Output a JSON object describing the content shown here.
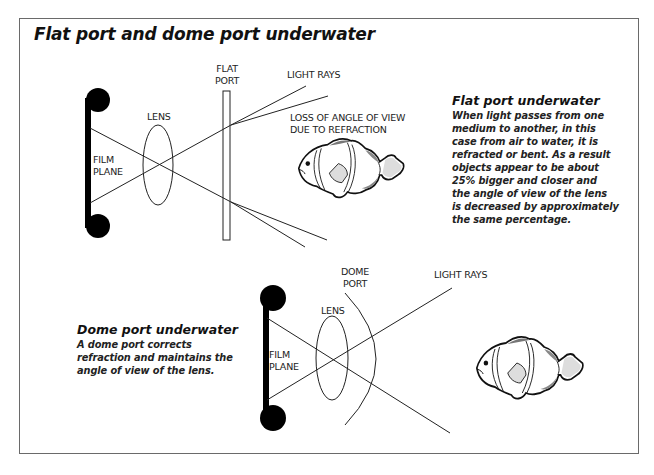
{
  "title": "Flat port and dome port underwater",
  "flat_diagram": {
    "labels": {
      "flat_port_line1": "FLAT",
      "flat_port_line2": "PORT",
      "light_rays": "LIGHT RAYS",
      "lens": "LENS",
      "film_plane_line1": "FILM",
      "film_plane_line2": "PLANE",
      "loss_line1": "LOSS OF ANGLE OF VIEW",
      "loss_line2": "DUE TO REFRACTION"
    }
  },
  "flat_note": {
    "heading": "Flat port underwater",
    "lines": [
      "When light passes from one",
      "medium to another, in this",
      "case from air to water, it is",
      "refracted or bent. As a result",
      "objects appear to be about",
      "25% bigger and closer and",
      "the angle of view of the lens",
      "is decreased by approximately",
      "the same percentage."
    ]
  },
  "dome_diagram": {
    "labels": {
      "dome_port_line1": "DOME",
      "dome_port_line2": "PORT",
      "light_rays": "LIGHT RAYS",
      "lens": "LENS",
      "film_plane_line1": "FILM",
      "film_plane_line2": "PLANE"
    }
  },
  "dome_note": {
    "heading": "Dome port underwater",
    "lines": [
      "A dome port corrects",
      "refraction and maintains the",
      "angle of view of the lens."
    ]
  },
  "icons": [
    "clownfish-icon",
    "clownfish-icon"
  ],
  "colors": {
    "line": "#222222",
    "frame": "#6a6a6a",
    "fill": "#000000"
  }
}
